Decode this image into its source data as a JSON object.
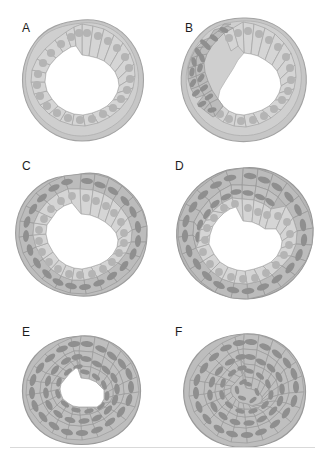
{
  "figure": {
    "background_color": "#ffffff",
    "width": 325,
    "height": 457,
    "layout": {
      "columns": 2,
      "rows": 3,
      "separator_line": true,
      "separator_color": "#d9d9d9"
    },
    "palette": {
      "epithelial_cell_fill": "#d5d5d5",
      "epithelial_cell_stroke": "#a8a8a8",
      "epithelial_nucleus": "#b4b4b4",
      "mesenchyme_cell_fill": "#b9b9b9",
      "mesenchyme_cell_stroke": "#9a9a9a",
      "mesenchyme_nucleus": "#8f8f8f",
      "outer_rim": "#c3c3c3",
      "outer_rim_stroke": "#a0a0a0",
      "lumen": "#ffffff",
      "label_color": "#1c1c1c"
    },
    "panels": [
      {
        "id": "A",
        "label": "A",
        "description": "Ring of columnar epithelial cells surrounding a large central lumen",
        "lumen": "large",
        "mesenchyme": "none",
        "label_x": 22,
        "label_y": 22
      },
      {
        "id": "B",
        "label": "B",
        "description": "Epithelial ring with a localized thickening of densely packed mesenchymal cells on one side; lumen narrowed and displaced",
        "lumen": "large-displaced",
        "mesenchyme": "localized-thickening",
        "label_x": 22,
        "label_y": 22
      },
      {
        "id": "C",
        "label": "C",
        "description": "Epithelial ring fully enveloped by a thin continuous outer layer of mesenchymal cells",
        "lumen": "large",
        "mesenchyme": "thin-continuous-layer",
        "label_x": 22,
        "label_y": 22
      },
      {
        "id": "D",
        "label": "D",
        "description": "Epithelial ring enveloped by a thickened multilayered mesenchymal coat",
        "lumen": "medium",
        "mesenchyme": "thick-multilayer",
        "label_x": 22,
        "label_y": 22
      },
      {
        "id": "E",
        "label": "E",
        "description": "Solid mass of mesenchymal cells with only a small residual central lumen",
        "lumen": "small",
        "mesenchyme": "solid-mass",
        "label_x": 22,
        "label_y": 22
      },
      {
        "id": "F",
        "label": "F",
        "description": "Fully solid spheroid of mesenchymal cells with no lumen",
        "lumen": "none",
        "mesenchyme": "solid-spheroid",
        "label_x": 22,
        "label_y": 22
      }
    ]
  }
}
